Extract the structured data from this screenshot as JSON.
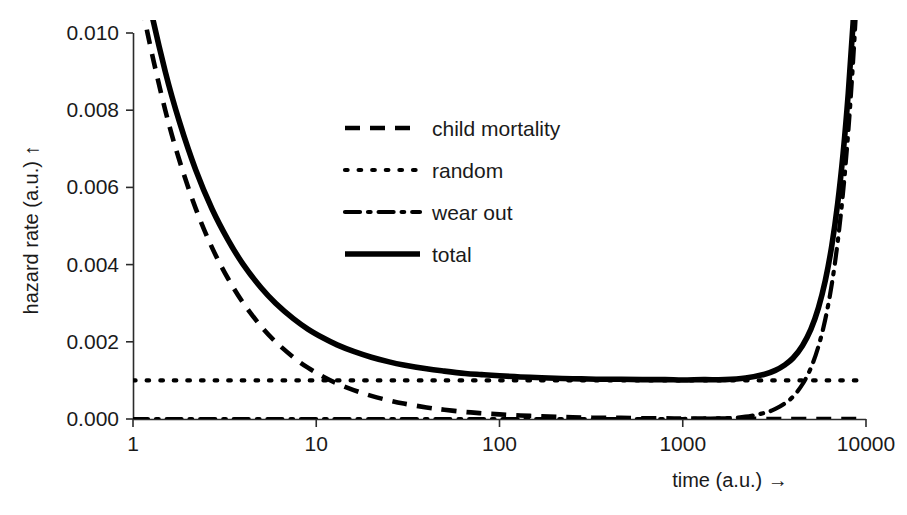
{
  "chart_data": {
    "type": "line",
    "title": "",
    "xlabel": "time (a.u.)  →",
    "ylabel": "hazard rate (a.u.)  ↑",
    "xscale": "log",
    "yscale": "linear",
    "xlim": [
      1,
      10000
    ],
    "ylim": [
      0.0,
      0.01
    ],
    "grid": false,
    "legend_position": "upper-center-left",
    "xticks": [
      1,
      10,
      100,
      1000,
      10000
    ],
    "xtick_labels": [
      "1",
      "10",
      "100",
      "1000",
      "10000"
    ],
    "yticks": [
      0.0,
      0.002,
      0.004,
      0.006,
      0.008,
      0.01
    ],
    "ytick_labels": [
      "0.000",
      "0.002",
      "0.004",
      "0.006",
      "0.008",
      "0.010"
    ],
    "x": [
      1,
      1.2,
      1.5,
      1.8,
      2.2,
      2.7,
      3.3,
      4,
      5,
      6,
      7.5,
      9,
      11,
      13,
      16,
      20,
      25,
      30,
      40,
      50,
      65,
      80,
      100,
      130,
      170,
      220,
      280,
      360,
      460,
      600,
      800,
      1000,
      1300,
      1700,
      2200,
      2800,
      3200,
      3600,
      4000,
      4500,
      5000,
      5500,
      6000,
      6500,
      7000,
      7500,
      8000,
      8500,
      9000,
      9500,
      10000
    ],
    "series": [
      {
        "name": "child mortality",
        "style": "dashed",
        "color": "#000000",
        "values": [
          0.012,
          0.01,
          0.008,
          0.00667,
          0.00545,
          0.00444,
          0.00364,
          0.003,
          0.0024,
          0.002,
          0.0016,
          0.00133,
          0.00109,
          0.00092,
          0.00075,
          0.0006,
          0.00048,
          0.0004,
          0.0003,
          0.00024,
          0.00018,
          0.00015,
          0.00012,
          9e-05,
          7e-05,
          5e-05,
          4e-05,
          3e-05,
          3e-05,
          2e-05,
          2e-05,
          1e-05,
          1e-05,
          1e-05,
          1e-05,
          0.0,
          0.0,
          0.0,
          0.0,
          0.0,
          0.0,
          0.0,
          0.0,
          0.0,
          0.0,
          0.0,
          0.0,
          0.0,
          0.0,
          0.0,
          0.0
        ]
      },
      {
        "name": "random",
        "style": "dotted",
        "color": "#000000",
        "values": [
          0.001,
          0.001,
          0.001,
          0.001,
          0.001,
          0.001,
          0.001,
          0.001,
          0.001,
          0.001,
          0.001,
          0.001,
          0.001,
          0.001,
          0.001,
          0.001,
          0.001,
          0.001,
          0.001,
          0.001,
          0.001,
          0.001,
          0.001,
          0.001,
          0.001,
          0.001,
          0.001,
          0.001,
          0.001,
          0.001,
          0.001,
          0.001,
          0.001,
          0.001,
          0.001,
          0.001,
          0.001,
          0.001,
          0.001,
          0.001,
          0.001,
          0.001,
          0.001,
          0.001,
          0.001,
          0.001,
          0.001,
          0.001,
          0.001,
          0.001,
          0.001
        ]
      },
      {
        "name": "wear out",
        "style": "dash-dot",
        "color": "#000000",
        "values": [
          0.0,
          0.0,
          0.0,
          0.0,
          0.0,
          0.0,
          0.0,
          0.0,
          0.0,
          0.0,
          0.0,
          0.0,
          0.0,
          0.0,
          0.0,
          0.0,
          0.0,
          0.0,
          0.0,
          0.0,
          0.0,
          0.0,
          0.0,
          0.0,
          0.0,
          0.0,
          0.0,
          0.0,
          0.0,
          0.0,
          0.0,
          0.0,
          1e-05,
          2e-05,
          6e-05,
          0.00016,
          0.00026,
          0.0004,
          0.00058,
          0.0009,
          0.00132,
          0.00188,
          0.00259,
          0.00348,
          0.00457,
          0.00588,
          0.00743,
          0.00925,
          0.01135,
          0.01377,
          0.0165
        ]
      },
      {
        "name": "total",
        "style": "solid",
        "color": "#000000",
        "values": [
          0.013,
          0.011,
          0.009,
          0.00767,
          0.00645,
          0.00544,
          0.00464,
          0.004,
          0.0034,
          0.003,
          0.0026,
          0.00233,
          0.00209,
          0.00192,
          0.00175,
          0.0016,
          0.00148,
          0.0014,
          0.0013,
          0.00124,
          0.00118,
          0.00115,
          0.00112,
          0.00109,
          0.00107,
          0.00105,
          0.00104,
          0.00103,
          0.00103,
          0.00102,
          0.00102,
          0.00101,
          0.00102,
          0.00102,
          0.00106,
          0.00116,
          0.00126,
          0.0014,
          0.00158,
          0.0019,
          0.00232,
          0.00288,
          0.00359,
          0.00448,
          0.00557,
          0.00688,
          0.00843,
          0.01025,
          0.01235,
          0.01477,
          0.0175
        ]
      }
    ]
  },
  "legend": {
    "entries": [
      {
        "label": "child mortality",
        "style": "dashed"
      },
      {
        "label": "random",
        "style": "dotted"
      },
      {
        "label": "wear out",
        "style": "dash-dot"
      },
      {
        "label": "total",
        "style": "solid"
      }
    ]
  },
  "axes": {
    "x_title": "time (a.u.)  →",
    "y_title": "hazard rate (a.u.)  ↑",
    "x_tick_labels": [
      "1",
      "10",
      "100",
      "1000",
      "10000"
    ],
    "y_tick_labels": [
      "0.000",
      "0.002",
      "0.004",
      "0.006",
      "0.008",
      "0.010"
    ]
  },
  "colors": {
    "ink": "#000000",
    "axis": "#2b2b2b",
    "background": "#ffffff"
  }
}
